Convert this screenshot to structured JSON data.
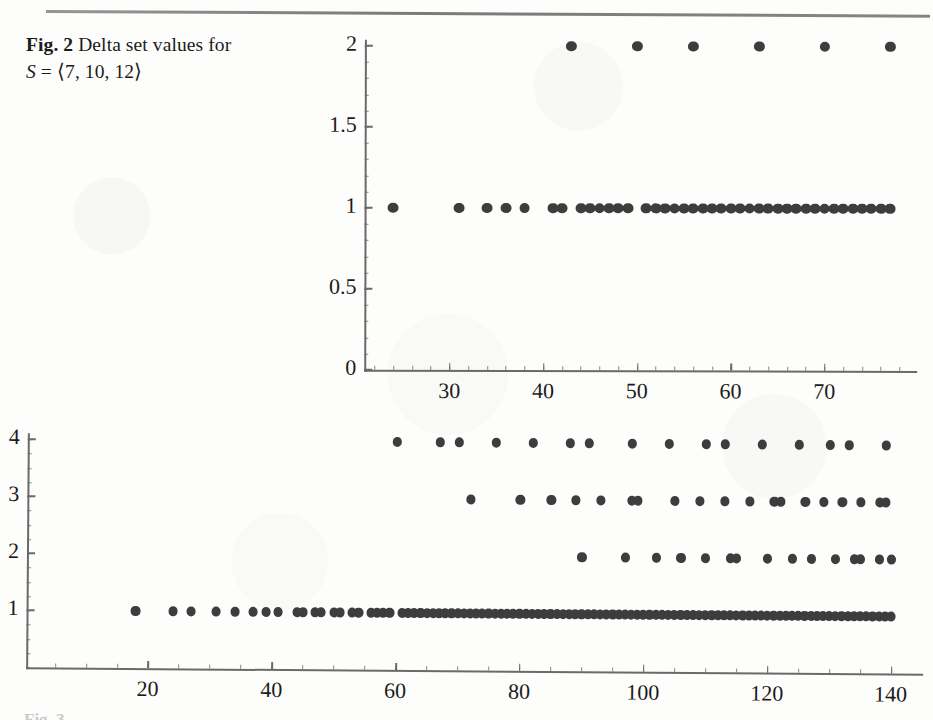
{
  "figure": {
    "label": "Fig. 2",
    "caption_line1": "Delta set values for",
    "caption_variable": "S",
    "caption_equals": "=",
    "caption_set": "⟨7, 10, 12⟩",
    "bottom_stub_text": "Fig. 3",
    "dot_color": "#3d3d3d",
    "axis_color": "#6a6a6a",
    "background_color": "#fdfdfc"
  },
  "chart_data": [
    {
      "type": "scatter",
      "title": "Delta set values for S = ⟨7, 10, 12⟩ (upper panel)",
      "xlabel": "",
      "ylabel": "",
      "xlim": [
        22,
        78
      ],
      "ylim": [
        0,
        2
      ],
      "xticks": [
        30,
        40,
        50,
        60,
        70
      ],
      "xtick_labels": [
        "30",
        "40",
        "50",
        "60",
        "70"
      ],
      "yticks": [
        0,
        0.5,
        1,
        1.5,
        2
      ],
      "ytick_labels": [
        "0",
        "0.5",
        "1",
        "1.5",
        "2"
      ],
      "minor_xtick_step": 2,
      "minor_ytick_step": 0.1,
      "grid": false,
      "legend": false,
      "series": [
        {
          "name": "delta set value 2",
          "y": 2,
          "x": [
            43,
            50,
            56,
            63,
            70,
            77
          ]
        },
        {
          "name": "delta set value 1",
          "y": 1,
          "x": [
            24,
            31,
            34,
            36,
            38,
            41,
            42,
            44,
            45,
            46,
            47,
            48,
            49,
            51,
            52,
            53,
            54,
            55,
            56,
            57,
            58,
            59,
            60,
            61,
            62,
            63,
            64,
            65,
            66,
            67,
            68,
            69,
            70,
            71,
            72,
            73,
            74,
            75,
            76,
            77
          ]
        }
      ]
    },
    {
      "type": "scatter",
      "title": "Delta set values for S = ⟨7, 10, 12⟩ (lower panel)",
      "xlabel": "",
      "ylabel": "",
      "xlim": [
        2,
        142
      ],
      "ylim": [
        0,
        4
      ],
      "xticks": [
        20,
        40,
        60,
        80,
        100,
        120,
        140
      ],
      "xtick_labels": [
        "20",
        "40",
        "60",
        "80",
        "100",
        "120",
        "140"
      ],
      "yticks": [
        1,
        2,
        3,
        4
      ],
      "ytick_labels": [
        "1",
        "2",
        "3",
        "4"
      ],
      "minor_xtick_step": 5,
      "minor_ytick_step": 0.25,
      "grid": false,
      "legend": false,
      "series": [
        {
          "name": "delta set value 4",
          "y": 4,
          "x": [
            60,
            67,
            70,
            76,
            82,
            88,
            91,
            98,
            104,
            110,
            113,
            119,
            125,
            130,
            133,
            139
          ]
        },
        {
          "name": "delta set value 3",
          "y": 3,
          "x": [
            72,
            80,
            85,
            89,
            93,
            98,
            99,
            105,
            109,
            113,
            117,
            121,
            122,
            126,
            129,
            132,
            135,
            138,
            139
          ]
        },
        {
          "name": "delta set value 2",
          "y": 2,
          "x": [
            90,
            97,
            102,
            106,
            110,
            114,
            115,
            120,
            124,
            127,
            131,
            134,
            135,
            138,
            140
          ]
        },
        {
          "name": "delta set value 1",
          "y": 1,
          "x": [
            18,
            24,
            27,
            31,
            34,
            37,
            39,
            41,
            44,
            45,
            47,
            48,
            50,
            51,
            53,
            54,
            56,
            57,
            58,
            59,
            61,
            62,
            63,
            64,
            65,
            66,
            67,
            68,
            69,
            70,
            71,
            72,
            73,
            74,
            75,
            76,
            77,
            78,
            79,
            80,
            81,
            82,
            83,
            84,
            85,
            86,
            87,
            88,
            89,
            90,
            91,
            92,
            93,
            94,
            95,
            96,
            97,
            98,
            99,
            100,
            101,
            102,
            103,
            104,
            105,
            106,
            107,
            108,
            109,
            110,
            111,
            112,
            113,
            114,
            115,
            116,
            117,
            118,
            119,
            120,
            121,
            122,
            123,
            124,
            125,
            126,
            127,
            128,
            129,
            130,
            131,
            132,
            133,
            134,
            135,
            136,
            137,
            138,
            139,
            140
          ]
        }
      ]
    }
  ]
}
